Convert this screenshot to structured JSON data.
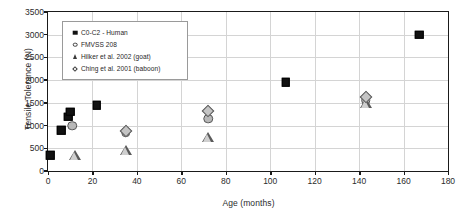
{
  "chart_data": {
    "type": "scatter",
    "title": "",
    "xlabel": "Age (months)",
    "ylabel": "Tensile Tolerance (N)",
    "xlim": [
      0,
      180
    ],
    "ylim": [
      0,
      3500
    ],
    "xticks": [
      0,
      20,
      40,
      60,
      80,
      100,
      120,
      140,
      160,
      180
    ],
    "yticks": [
      0,
      500,
      1000,
      1500,
      2000,
      2500,
      3000,
      3500
    ],
    "grid": true,
    "legend_position": "upper-left",
    "series": [
      {
        "name": "C0-C2 - Human",
        "marker": "square",
        "color": "#111111",
        "points": [
          {
            "x": 1,
            "y": 350
          },
          {
            "x": 6,
            "y": 900
          },
          {
            "x": 9,
            "y": 1195
          },
          {
            "x": 10,
            "y": 1300
          },
          {
            "x": 22,
            "y": 1450
          },
          {
            "x": 107,
            "y": 1950
          },
          {
            "x": 167,
            "y": 3000
          }
        ]
      },
      {
        "name": "FMVSS 208",
        "marker": "circle",
        "color": "#b8b8b8",
        "points": [
          {
            "x": 11,
            "y": 1000
          },
          {
            "x": 35,
            "y": 855
          },
          {
            "x": 72,
            "y": 1150
          },
          {
            "x": 143,
            "y": 1555
          }
        ]
      },
      {
        "name": "Hilker et al. 2002 (goat)",
        "marker": "triangle",
        "color": "#cfcfcf",
        "points": [
          {
            "x": 12,
            "y": 350
          },
          {
            "x": 35,
            "y": 450
          },
          {
            "x": 72,
            "y": 745
          },
          {
            "x": 143,
            "y": 1500
          }
        ]
      },
      {
        "name": "Ching et al. 2001 (baboon)",
        "marker": "diamond",
        "color": "#c4c4c4",
        "points": [
          {
            "x": 35,
            "y": 880
          },
          {
            "x": 72,
            "y": 1330
          },
          {
            "x": 143,
            "y": 1620
          }
        ]
      }
    ]
  },
  "axis": {
    "x_title": "Age (months)",
    "y_title": "Tensile Tolerance (N)",
    "x_tick_labels": [
      "0",
      "20",
      "40",
      "60",
      "80",
      "100",
      "120",
      "140",
      "160",
      "180"
    ],
    "y_tick_labels": [
      "0",
      "500",
      "1000",
      "1500",
      "2000",
      "2500",
      "3000",
      "3500"
    ]
  },
  "legend": {
    "entries": [
      {
        "label": "C0-C2 - Human",
        "marker": "square"
      },
      {
        "label": "FMVSS 208",
        "marker": "circle"
      },
      {
        "label": "Hilker et al. 2002 (goat)",
        "marker": "triangle"
      },
      {
        "label": "Ching et al. 2001 (baboon)",
        "marker": "diamond"
      }
    ]
  },
  "colors": {
    "axis": "#1a1a1a",
    "grid": "#d4d4d4",
    "background": "#ffffff",
    "square_marker": "#111111",
    "circle_marker": "#b8b8b8",
    "triangle_marker": "#cfcfcf",
    "diamond_marker": "#c4c4c4"
  }
}
